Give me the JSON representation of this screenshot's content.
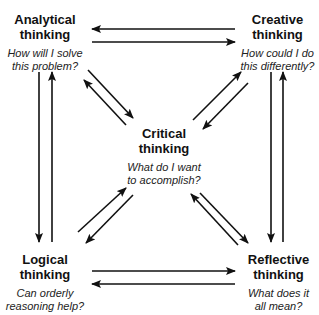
{
  "nodes": {
    "analytical": {
      "title_line1": "Analytical",
      "title_line2": "thinking",
      "question_line1": "How will I solve",
      "question_line2": "this problem?"
    },
    "creative": {
      "title_line1": "Creative",
      "title_line2": "thinking",
      "question_line1": "How could I do",
      "question_line2": "this differently?"
    },
    "critical": {
      "title_line1": "Critical",
      "title_line2": "thinking",
      "question_line1": "What do I want",
      "question_line2": "to accomplish?"
    },
    "logical": {
      "title_line1": "Logical",
      "title_line2": "thinking",
      "question_line1": "Can orderly",
      "question_line2": "reasoning help?"
    },
    "reflective": {
      "title_line1": "Reflective",
      "title_line2": "thinking",
      "question_line1": "What does it",
      "question_line2": "all mean?"
    }
  },
  "edges": [
    {
      "from": "creative",
      "to": "analytical"
    },
    {
      "from": "analytical",
      "to": "creative"
    },
    {
      "from": "logical",
      "to": "reflective"
    },
    {
      "from": "reflective",
      "to": "logical"
    },
    {
      "from": "analytical",
      "to": "logical"
    },
    {
      "from": "logical",
      "to": "analytical"
    },
    {
      "from": "creative",
      "to": "reflective"
    },
    {
      "from": "reflective",
      "to": "creative"
    },
    {
      "from": "analytical",
      "to": "critical"
    },
    {
      "from": "critical",
      "to": "analytical"
    },
    {
      "from": "critical",
      "to": "creative"
    },
    {
      "from": "creative",
      "to": "critical"
    },
    {
      "from": "logical",
      "to": "critical"
    },
    {
      "from": "critical",
      "to": "logical"
    },
    {
      "from": "reflective",
      "to": "critical"
    },
    {
      "from": "critical",
      "to": "reflective"
    }
  ],
  "colors": {
    "stroke": "#111111",
    "background": "#ffffff"
  }
}
